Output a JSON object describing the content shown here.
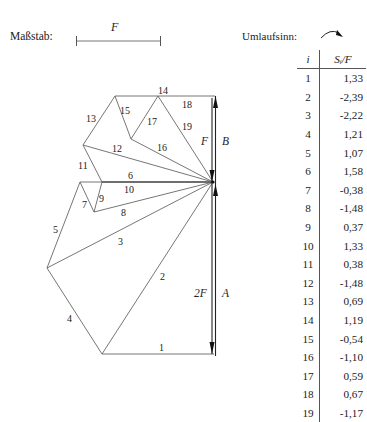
{
  "header": {
    "scale_label": "Maßstab:",
    "scale_symbol": "F",
    "rotation_label": "Umlaufsinn:",
    "rotation_icon": "clockwise-arrow-icon"
  },
  "table": {
    "col_i": "i",
    "col_s": "Sᵢ/F",
    "rows": [
      {
        "i": "1",
        "s": "1,33"
      },
      {
        "i": "2",
        "s": "-2,39"
      },
      {
        "i": "3",
        "s": "-2,22"
      },
      {
        "i": "4",
        "s": "1,21"
      },
      {
        "i": "5",
        "s": "1,07"
      },
      {
        "i": "6",
        "s": "1,58"
      },
      {
        "i": "7",
        "s": "-0,38"
      },
      {
        "i": "8",
        "s": "-1,48"
      },
      {
        "i": "9",
        "s": "0,37"
      },
      {
        "i": "10",
        "s": "1,33"
      },
      {
        "i": "11",
        "s": "0,38"
      },
      {
        "i": "12",
        "s": "-1,48"
      },
      {
        "i": "13",
        "s": "0,69"
      },
      {
        "i": "14",
        "s": "1,19"
      },
      {
        "i": "15",
        "s": "-0,54"
      },
      {
        "i": "16",
        "s": "-1,10"
      },
      {
        "i": "17",
        "s": "0,59"
      },
      {
        "i": "18",
        "s": "0,67"
      },
      {
        "i": "19",
        "s": "-1,17"
      }
    ]
  },
  "diagram": {
    "force_labels": {
      "upper_force": "F",
      "upper_support": "B",
      "lower_force": "2F",
      "lower_support": "A"
    },
    "member_labels": [
      "1",
      "2",
      "3",
      "4",
      "5",
      "6",
      "7",
      "8",
      "9",
      "10",
      "11",
      "12",
      "13",
      "14",
      "15",
      "16",
      "17",
      "18",
      "19"
    ]
  }
}
